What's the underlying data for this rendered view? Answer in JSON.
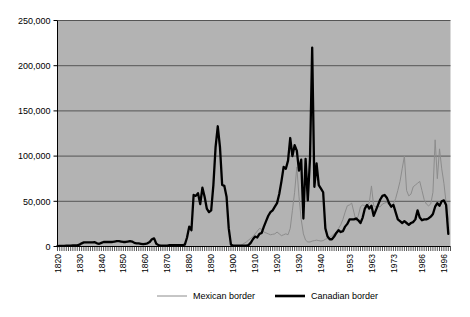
{
  "chart_data": {
    "type": "line",
    "title": "",
    "subtitle": "",
    "xlabel": "",
    "ylabel": "",
    "xlim": [
      1820,
      1999
    ],
    "ylim": [
      0,
      250000
    ],
    "grid": true,
    "legend_position": "bottom",
    "y_ticks": [
      0,
      50000,
      100000,
      150000,
      200000,
      250000
    ],
    "y_tick_labels": [
      "0",
      "50,000",
      "100,000",
      "150,000",
      "200,000",
      "250,000"
    ],
    "x_tick_years": [
      1820,
      1830,
      1840,
      1850,
      1860,
      1870,
      1880,
      1890,
      1900,
      1910,
      1920,
      1930,
      1940,
      1953,
      1963,
      1973,
      1986,
      1996
    ],
    "x_tick_labels": [
      "1820",
      "1830",
      "1840",
      "1850",
      "1860",
      "1870",
      "1880",
      "1890",
      "1900",
      "1910",
      "1920",
      "1930",
      "1940",
      "1953",
      "1963",
      "1973",
      "1986",
      "1996"
    ],
    "plot_bg_color": "#b3b3b3",
    "grid_color": "#555555",
    "axis_color": "#000000",
    "series": [
      {
        "name": "Mexican border",
        "color": "#8c8c8c",
        "line_width": 1,
        "x": [
          1903,
          1904,
          1905,
          1906,
          1907,
          1908,
          1909,
          1910,
          1911,
          1912,
          1913,
          1914,
          1915,
          1916,
          1917,
          1918,
          1919,
          1920,
          1921,
          1922,
          1923,
          1924,
          1925,
          1926,
          1927,
          1928,
          1929,
          1930,
          1931,
          1932,
          1933,
          1934,
          1935,
          1936,
          1937,
          1938,
          1939,
          1940,
          1941,
          1942,
          1943,
          1944,
          1945,
          1946,
          1947,
          1948,
          1949,
          1950,
          1951,
          1952,
          1953,
          1954,
          1955,
          1956,
          1957,
          1958,
          1959,
          1960,
          1961,
          1962,
          1963,
          1964,
          1965,
          1966,
          1967,
          1968,
          1969,
          1970,
          1971,
          1972,
          1973,
          1974,
          1975,
          1976,
          1977,
          1978,
          1979,
          1980,
          1981,
          1982,
          1983,
          1984,
          1985,
          1986,
          1987,
          1988,
          1989,
          1990,
          1991,
          1992,
          1993,
          1994,
          1995,
          1996,
          1997,
          1998
        ],
        "values": [
          1000,
          2000,
          3500,
          5000,
          7000,
          9000,
          11000,
          14000,
          17000,
          20000,
          19000,
          16000,
          15000,
          14000,
          13000,
          13500,
          14000,
          16000,
          14000,
          12000,
          13000,
          14000,
          13000,
          20000,
          40000,
          60000,
          88000,
          55000,
          30000,
          14000,
          7000,
          5000,
          5000,
          6000,
          6500,
          7000,
          6500,
          6000,
          6500,
          8000,
          9000,
          10000,
          12000,
          14000,
          16000,
          20000,
          24000,
          30000,
          38000,
          45000,
          46000,
          48000,
          38000,
          28000,
          34000,
          44000,
          46000,
          45000,
          46000,
          48000,
          67000,
          45000,
          44000,
          44000,
          44000,
          47000,
          48000,
          49000,
          46000,
          45000,
          47000,
          53000,
          62000,
          72000,
          86000,
          100000,
          62000,
          56000,
          58000,
          66000,
          68000,
          70000,
          72000,
          62000,
          52000,
          47000,
          45000,
          47000,
          60000,
          118000,
          75000,
          108000,
          86000,
          70000,
          48000,
          30000
        ]
      },
      {
        "name": "Canadian border",
        "color": "#000000",
        "line_width": 2.3,
        "x": [
          1820,
          1821,
          1822,
          1823,
          1824,
          1825,
          1826,
          1827,
          1828,
          1829,
          1830,
          1831,
          1832,
          1833,
          1834,
          1835,
          1836,
          1837,
          1838,
          1839,
          1840,
          1841,
          1842,
          1843,
          1844,
          1845,
          1846,
          1847,
          1848,
          1849,
          1850,
          1851,
          1852,
          1853,
          1854,
          1855,
          1856,
          1857,
          1858,
          1859,
          1860,
          1861,
          1862,
          1863,
          1864,
          1865,
          1866,
          1867,
          1868,
          1869,
          1870,
          1871,
          1872,
          1873,
          1874,
          1875,
          1876,
          1877,
          1878,
          1879,
          1880,
          1881,
          1882,
          1883,
          1884,
          1885,
          1886,
          1887,
          1888,
          1889,
          1890,
          1891,
          1892,
          1893,
          1894,
          1895,
          1896,
          1897,
          1898,
          1899,
          1900,
          1901,
          1902,
          1903,
          1904,
          1905,
          1906,
          1907,
          1908,
          1909,
          1910,
          1911,
          1912,
          1913,
          1914,
          1915,
          1916,
          1917,
          1918,
          1919,
          1920,
          1921,
          1922,
          1923,
          1924,
          1925,
          1926,
          1927,
          1928,
          1929,
          1930,
          1931,
          1932,
          1933,
          1934,
          1935,
          1936,
          1937,
          1938,
          1939,
          1940,
          1941,
          1942,
          1943,
          1944,
          1945,
          1946,
          1947,
          1948,
          1949,
          1950,
          1951,
          1952,
          1953,
          1954,
          1955,
          1956,
          1957,
          1958,
          1959,
          1960,
          1961,
          1962,
          1963,
          1964,
          1965,
          1966,
          1967,
          1968,
          1969,
          1970,
          1971,
          1972,
          1973,
          1974,
          1975,
          1976,
          1977,
          1978,
          1979,
          1980,
          1981,
          1982,
          1983,
          1984,
          1985,
          1986,
          1987,
          1988,
          1989,
          1990,
          1991,
          1992,
          1993,
          1994,
          1995,
          1996,
          1997,
          1998
        ],
        "values": [
          500,
          600,
          700,
          800,
          900,
          900,
          1000,
          1100,
          1200,
          1300,
          2000,
          3500,
          4500,
          4500,
          4500,
          4500,
          4500,
          4800,
          3500,
          3000,
          4000,
          5000,
          5000,
          5000,
          5000,
          5000,
          5500,
          6000,
          6000,
          5500,
          5000,
          5000,
          5500,
          6000,
          5500,
          4000,
          3500,
          3500,
          3000,
          2500,
          3000,
          3500,
          5000,
          8000,
          9000,
          3000,
          1500,
          1000,
          1000,
          1000,
          1000,
          1500,
          1500,
          1500,
          1500,
          1500,
          1500,
          1500,
          2000,
          10000,
          22000,
          18000,
          57000,
          56000,
          59000,
          47000,
          65000,
          55000,
          42000,
          38000,
          40000,
          68000,
          110000,
          133000,
          110000,
          68000,
          67000,
          55000,
          20000,
          2000,
          1000,
          1000,
          1000,
          1000,
          1000,
          1000,
          1000,
          1500,
          4000,
          8000,
          11000,
          10000,
          14000,
          15000,
          22000,
          28000,
          34000,
          38000,
          40000,
          44000,
          48000,
          58000,
          72000,
          88000,
          86000,
          95000,
          120000,
          100000,
          112000,
          106000,
          84000,
          96000,
          31000,
          97000,
          51000,
          97000,
          220000,
          66000,
          92000,
          68000,
          64000,
          60000,
          20000,
          11000,
          8000,
          8000,
          11000,
          15000,
          18000,
          16000,
          17000,
          22000,
          25000,
          30000,
          30000,
          30000,
          31000,
          29000,
          26000,
          32000,
          42000,
          46000,
          42000,
          45000,
          34000,
          40000,
          46000,
          52000,
          56000,
          57000,
          54000,
          48000,
          44000,
          46000,
          38000,
          30000,
          28000,
          26000,
          28000,
          26000,
          24000,
          26000,
          27000,
          30000,
          40000,
          32000,
          29000,
          30000,
          30000,
          31000,
          33000,
          36000,
          44000,
          48000,
          45000,
          50000,
          51000,
          46000,
          14000
        ]
      }
    ],
    "legend_entries": [
      {
        "label": "Mexican border",
        "color": "#8c8c8c",
        "width": 1
      },
      {
        "label": "Canadian border",
        "color": "#000000",
        "width": 2.6
      }
    ]
  }
}
